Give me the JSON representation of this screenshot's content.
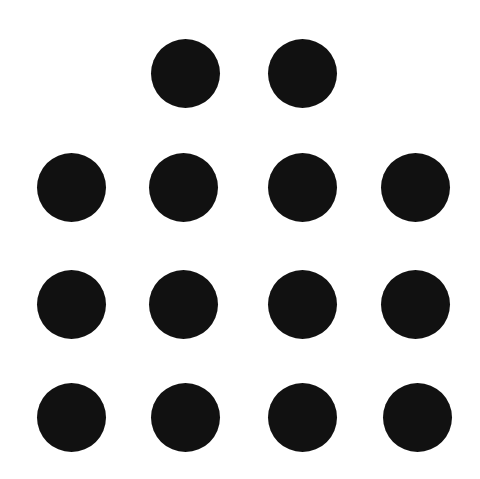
{
  "canvas": {
    "width": 480,
    "height": 479,
    "background": "#ffffff"
  },
  "dot_style": {
    "color": "#111111",
    "diameter": 69
  },
  "dots": [
    {
      "row": 1,
      "col": 2,
      "cx": 185,
      "cy": 73
    },
    {
      "row": 1,
      "col": 3,
      "cx": 302,
      "cy": 73
    },
    {
      "row": 2,
      "col": 1,
      "cx": 71,
      "cy": 187
    },
    {
      "row": 2,
      "col": 2,
      "cx": 183,
      "cy": 187
    },
    {
      "row": 2,
      "col": 3,
      "cx": 302,
      "cy": 187
    },
    {
      "row": 2,
      "col": 4,
      "cx": 415,
      "cy": 187
    },
    {
      "row": 3,
      "col": 1,
      "cx": 71,
      "cy": 304
    },
    {
      "row": 3,
      "col": 2,
      "cx": 183,
      "cy": 304
    },
    {
      "row": 3,
      "col": 3,
      "cx": 302,
      "cy": 304
    },
    {
      "row": 3,
      "col": 4,
      "cx": 415,
      "cy": 304
    },
    {
      "row": 4,
      "col": 1,
      "cx": 71,
      "cy": 417
    },
    {
      "row": 4,
      "col": 2,
      "cx": 185,
      "cy": 417
    },
    {
      "row": 4,
      "col": 3,
      "cx": 302,
      "cy": 417
    },
    {
      "row": 4,
      "col": 4,
      "cx": 417,
      "cy": 417
    }
  ],
  "counts": {
    "total_dots": 14,
    "rows": [
      2,
      4,
      4,
      4
    ]
  }
}
